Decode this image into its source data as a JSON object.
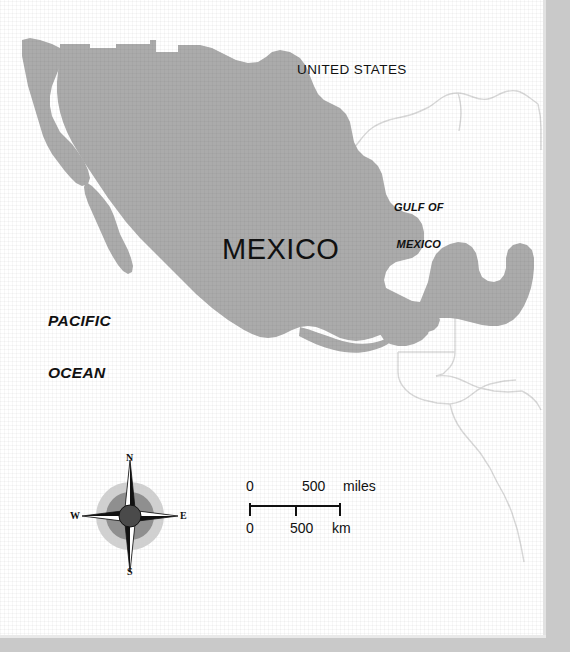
{
  "map": {
    "title": "Mexico",
    "labels": {
      "united_states": "UNITED STATES",
      "mexico": "MEXICO",
      "gulf_of_mexico_line1": "GULF OF",
      "gulf_of_mexico_line2": "MEXICO",
      "pacific_ocean_line1": "PACIFIC",
      "pacific_ocean_line2": "OCEAN"
    },
    "colors": {
      "country_fill": "#ababab",
      "neighbor_outline": "#d8d8d8",
      "background": "#ffffff",
      "frame_band": "#c9c9c9",
      "text": "#111111",
      "compass_outer_ring": "#d0d0d0",
      "compass_mid_ring": "#8f8f8f",
      "compass_hub": "#4a4a4a"
    },
    "compass": {
      "north": "N",
      "south": "S",
      "east": "E",
      "west": "W"
    },
    "scale": {
      "miles_start": "0",
      "miles_end": "500",
      "miles_unit": "miles",
      "km_start": "0",
      "km_end": "500",
      "km_unit": "km"
    }
  }
}
